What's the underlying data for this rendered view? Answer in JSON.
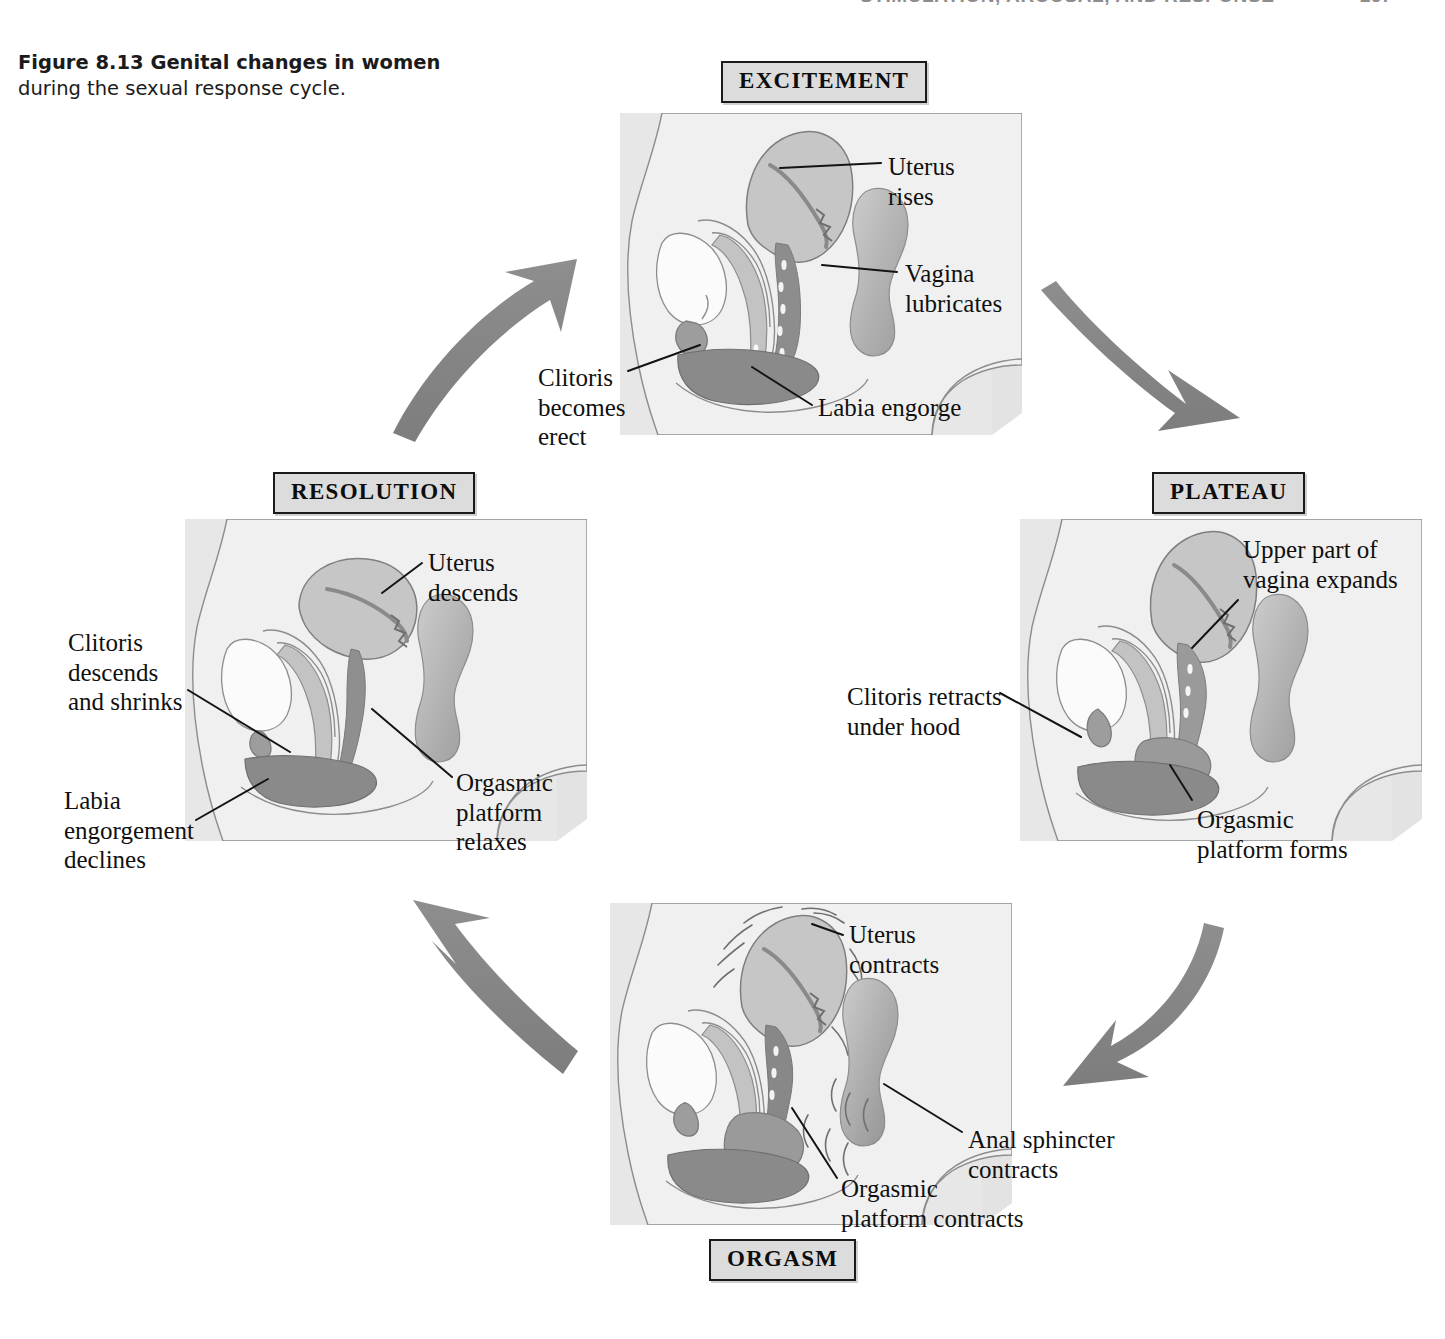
{
  "running_head": {
    "title": "STIMULATION, AROUSAL, AND RESPONSE",
    "page_number": "267"
  },
  "caption": {
    "bold_part": "Figure 8.13  Genital changes in women",
    "rest_part": "during the sexual response cycle."
  },
  "stages": {
    "excitement": {
      "label": "EXCITEMENT",
      "callouts": {
        "uterus": "Uterus\nrises",
        "vagina": "Vagina\nlubricates",
        "clitoris": "Clitoris\nbecomes\nerect",
        "labia": "Labia engorge"
      }
    },
    "plateau": {
      "label": "PLATEAU",
      "callouts": {
        "upper_vagina": "Upper part of\nvagina expands",
        "clitoris": "Clitoris retracts\nunder hood",
        "orgasmic_platform": "Orgasmic\nplatform forms"
      }
    },
    "orgasm": {
      "label": "ORGASM",
      "callouts": {
        "uterus": "Uterus\ncontracts",
        "anal_sphincter": "Anal sphincter\n   contracts",
        "orgasmic_platform": "Orgasmic\nplatform contracts"
      }
    },
    "resolution": {
      "label": "RESOLUTION",
      "callouts": {
        "uterus": "Uterus\ndescends",
        "clitoris": "Clitoris\ndescends\nand shrinks",
        "labia": "Labia\nengorgement\ndeclines",
        "orgasmic_platform": "Orgasmic\nplatform\nrelaxes"
      }
    }
  },
  "cycle_order": [
    "excitement",
    "plateau",
    "orgasm",
    "resolution"
  ],
  "colors": {
    "arrow_gray": "#8a8a8a",
    "box_fill": "#dcdcdc",
    "box_border": "#1a1a1a",
    "panel_bg": "#e9e9e9",
    "body_fill": "#efefef",
    "uterus_fill": "#c8c8c8",
    "uterus_inner": "#a9a9a9",
    "engorged_fill": "#8f8f8f",
    "rectum_fill": "#b4b4b4",
    "line_color": "#6e6e6e",
    "text_color": "#101010"
  }
}
